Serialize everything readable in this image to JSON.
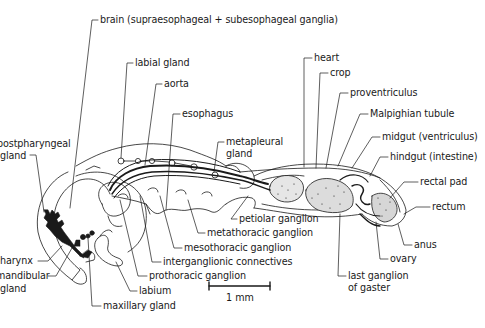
{
  "diagram": {
    "ink_color": "#1a1a1a",
    "background": "#ffffff",
    "scale_bar": {
      "label": "1 mm"
    },
    "labels": [
      {
        "id": "brain",
        "text": "brain (supraesophageal + subesophageal ganglia)",
        "x": 100,
        "y": 14
      },
      {
        "id": "labial-gland",
        "text": "labial gland",
        "x": 135,
        "y": 57
      },
      {
        "id": "aorta",
        "text": "aorta",
        "x": 164,
        "y": 78
      },
      {
        "id": "esophagus",
        "text": "esophagus",
        "x": 182,
        "y": 108
      },
      {
        "id": "postpharyngeal-gland-1",
        "text": "postpharyngeal",
        "x": -3,
        "y": 138
      },
      {
        "id": "postpharyngeal-gland-2",
        "text": "gland",
        "x": 0,
        "y": 150
      },
      {
        "id": "metapleural-gland-1",
        "text": "metapleural",
        "x": 226,
        "y": 136
      },
      {
        "id": "metapleural-gland-2",
        "text": "gland",
        "x": 226,
        "y": 148
      },
      {
        "id": "heart",
        "text": "heart",
        "x": 314,
        "y": 52
      },
      {
        "id": "crop",
        "text": "crop",
        "x": 330,
        "y": 67
      },
      {
        "id": "proventriculus",
        "text": "proventriculus",
        "x": 350,
        "y": 87
      },
      {
        "id": "malpighian-tubule",
        "text": "Malpighian tubule",
        "x": 370,
        "y": 108
      },
      {
        "id": "midgut",
        "text": "midgut (ventriculus)",
        "x": 382,
        "y": 131
      },
      {
        "id": "hindgut",
        "text": "hindgut (intestine)",
        "x": 390,
        "y": 151
      },
      {
        "id": "rectal-pad",
        "text": "rectal pad",
        "x": 420,
        "y": 176
      },
      {
        "id": "rectum",
        "text": "rectum",
        "x": 432,
        "y": 201
      },
      {
        "id": "anus",
        "text": "anus",
        "x": 414,
        "y": 239
      },
      {
        "id": "ovary",
        "text": "ovary",
        "x": 390,
        "y": 253
      },
      {
        "id": "last-ganglion-1",
        "text": "last ganglion",
        "x": 348,
        "y": 270
      },
      {
        "id": "last-ganglion-2",
        "text": "of gaster",
        "x": 348,
        "y": 282
      },
      {
        "id": "petiolar-ganglion",
        "text": "petiolar ganglion",
        "x": 239,
        "y": 213
      },
      {
        "id": "metathoracic-ganglion",
        "text": "metathoracic ganglion",
        "x": 207,
        "y": 227
      },
      {
        "id": "mesothoracic-ganglion",
        "text": "mesothoracic ganglion",
        "x": 184,
        "y": 242
      },
      {
        "id": "interganglionic-connectives",
        "text": "interganglionic connectives",
        "x": 163,
        "y": 256
      },
      {
        "id": "prothoracic-ganglion",
        "text": "prothoracic ganglion",
        "x": 149,
        "y": 270
      },
      {
        "id": "labium",
        "text": "labium",
        "x": 139,
        "y": 285
      },
      {
        "id": "maxillary-gland",
        "text": "maxillary gland",
        "x": 103,
        "y": 300
      },
      {
        "id": "pharynx",
        "text": "pharynx",
        "x": -6,
        "y": 255
      },
      {
        "id": "mandibular-gland-1",
        "text": "mandibular",
        "x": -4,
        "y": 270
      },
      {
        "id": "mandibular-gland-2",
        "text": "gland",
        "x": 0,
        "y": 283
      }
    ]
  }
}
